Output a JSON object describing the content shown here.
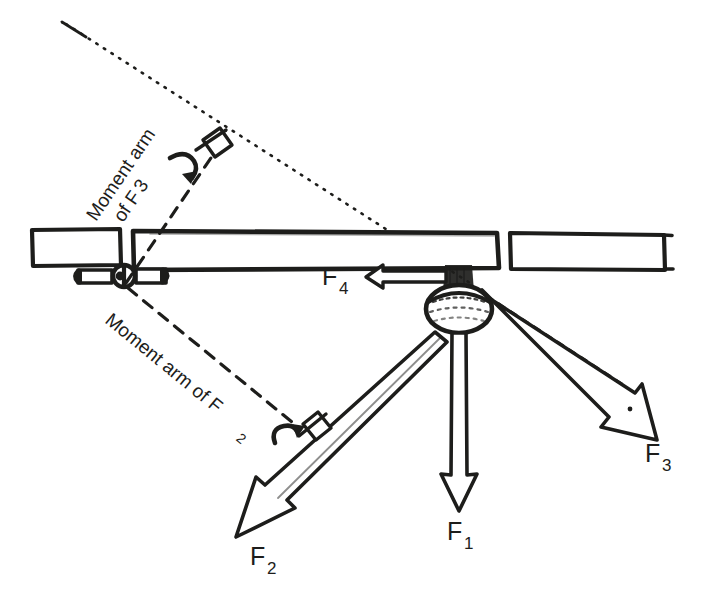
{
  "figure": {
    "ink_color": "#1d1d1b",
    "background_color": "#ffffff",
    "width": 704,
    "height": 594
  },
  "labels": {
    "moment_arm_f3": {
      "text": "Moment arm",
      "text2": "of F",
      "subscript": "3"
    },
    "moment_arm_f2": {
      "text": "Moment arm of F",
      "subscript": "2"
    },
    "force_1": {
      "symbol": "F",
      "subscript": "1"
    },
    "force_2": {
      "symbol": "F",
      "subscript": "2"
    },
    "force_3": {
      "symbol": "F",
      "subscript": "3"
    },
    "force_4": {
      "symbol": "F",
      "subscript": "4"
    }
  },
  "annotations": {
    "right_angle_upper": "right-angle-marker",
    "right_angle_lower": "right-angle-marker",
    "moment_arc_upper": "curved-moment-arrow",
    "moment_arc_lower": "curved-moment-arrow",
    "line_of_action_f3": "dotted-extension-line",
    "centerline_f3": "dashed-centerline"
  },
  "parts": {
    "beam_left_segment": "beam-left-segment",
    "beam_main": "beam-main",
    "beam_right_segment": "beam-right-segment",
    "pivot_hinge": "pivot-hinge",
    "hub": "central-hub-knob"
  }
}
